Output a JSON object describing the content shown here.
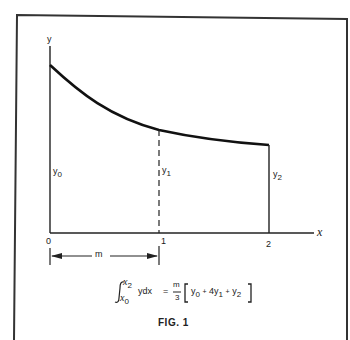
{
  "figure": {
    "caption": "FIG. 1",
    "y_axis_label": "y",
    "x_axis_label": "x",
    "ticks": [
      "0",
      "1",
      "2"
    ],
    "ordinates": [
      {
        "base": "y",
        "sub": "0"
      },
      {
        "base": "y",
        "sub": "1"
      },
      {
        "base": "y",
        "sub": "2"
      }
    ],
    "interval_label": "m",
    "formula": {
      "upper_limit": "x",
      "upper_limit_sub": "2",
      "lower_limit": "x",
      "lower_limit_sub": "0",
      "integrand": "y",
      "dx": "dx",
      "equals": "=",
      "frac_num": "m",
      "frac_den": "3",
      "term0": "y",
      "term0_sub": "0",
      "plus1": "+",
      "coef": "4y",
      "term1_sub": "1",
      "plus2": "+",
      "term2": "y",
      "term2_sub": "2"
    },
    "colors": {
      "ink": "#1a1a1a",
      "background": "#ffffff"
    }
  }
}
